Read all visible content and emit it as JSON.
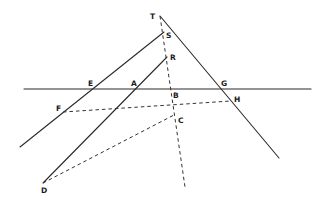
{
  "diagram": {
    "points": {
      "T": {
        "label": "T",
        "x": 160,
        "y": 16
      },
      "S": {
        "label": "S",
        "x": 164,
        "y": 32
      },
      "R": {
        "label": "R",
        "x": 167,
        "y": 57
      },
      "E": {
        "label": "E",
        "x": 92,
        "y": 89
      },
      "A": {
        "label": "A",
        "x": 135,
        "y": 89
      },
      "B": {
        "label": "B",
        "x": 172,
        "y": 89
      },
      "G": {
        "label": "G",
        "x": 222,
        "y": 89
      },
      "H": {
        "label": "H",
        "x": 231,
        "y": 101
      },
      "F": {
        "label": "F",
        "x": 63,
        "y": 112
      },
      "C": {
        "label": "C",
        "x": 174,
        "y": 115
      },
      "D": {
        "label": "D",
        "x": 43,
        "y": 183
      }
    },
    "labels": [
      {
        "id": "T",
        "text": "T",
        "x": 150,
        "y": 19
      },
      {
        "id": "S",
        "text": "S",
        "x": 166,
        "y": 38
      },
      {
        "id": "R",
        "text": "R",
        "x": 170,
        "y": 60
      },
      {
        "id": "E",
        "text": "E",
        "x": 88,
        "y": 86
      },
      {
        "id": "A",
        "text": "A",
        "x": 131,
        "y": 86
      },
      {
        "id": "B",
        "text": "B",
        "x": 173,
        "y": 98
      },
      {
        "id": "G",
        "text": "G",
        "x": 221,
        "y": 86
      },
      {
        "id": "H",
        "text": "H",
        "x": 234,
        "y": 102
      },
      {
        "id": "F",
        "text": "F",
        "x": 56,
        "y": 111
      },
      {
        "id": "C",
        "text": "C",
        "x": 178,
        "y": 123
      },
      {
        "id": "D",
        "text": "D",
        "x": 41,
        "y": 193
      }
    ],
    "solid_lines": [
      {
        "name": "horizontal-line",
        "x1": 24,
        "y1": 89,
        "x2": 311,
        "y2": 89
      },
      {
        "name": "line-s-e-f",
        "x1": 164,
        "y1": 32,
        "x2": 20,
        "y2": 147
      },
      {
        "name": "line-r-a-d",
        "x1": 167,
        "y1": 57,
        "x2": 43,
        "y2": 183
      },
      {
        "name": "line-t-g-h",
        "x1": 160,
        "y1": 16,
        "x2": 279,
        "y2": 158
      }
    ],
    "dashed_lines": [
      {
        "name": "dashed-t-s-r-b-c",
        "x1": 160,
        "y1": 16,
        "x2": 185,
        "y2": 187
      },
      {
        "name": "dashed-f-c-h",
        "x1": 63,
        "y1": 112,
        "x2": 231,
        "y2": 101
      },
      {
        "name": "dashed-d-c",
        "x1": 43,
        "y1": 183,
        "x2": 174,
        "y2": 115
      }
    ]
  }
}
